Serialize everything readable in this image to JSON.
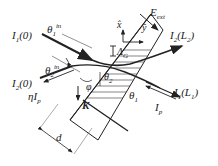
{
  "labels": {
    "I1_0": {
      "main": "I",
      "sub": "1",
      "rest": "(0)"
    },
    "theta1_in": {
      "main": "θ",
      "sub": "1",
      "sup": "in"
    },
    "theta2_in": {
      "main": "θ",
      "sub": "2",
      "sup": "in"
    },
    "I2_0": {
      "main": "I",
      "sub": "2",
      "rest": "(0)"
    },
    "eta_Ip": {
      "main": "ηI",
      "sub": "p"
    },
    "E_ext": {
      "main": "E",
      "sub": "ext"
    },
    "I2_L2": {
      "main": "I",
      "sub": "2",
      "rest": "(L",
      "sub2": "2",
      "rest2": ")"
    },
    "I1_L1": {
      "main": "I",
      "sub": "1",
      "rest": "(L",
      "sub2": "1",
      "rest2": ")"
    },
    "Ip": {
      "main": "I",
      "sub": "p"
    },
    "theta1": {
      "main": "θ",
      "sub": "1"
    },
    "theta2": {
      "main": "θ",
      "sub": "2"
    },
    "phi": "φ",
    "K": "K",
    "d": "d",
    "x_hat": "x̂",
    "y_hat": "ŷ",
    "Lambda_G": {
      "main": "Λ",
      "sub": "G"
    }
  }
}
